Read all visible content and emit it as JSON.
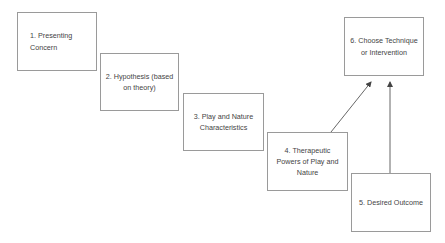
{
  "diagram": {
    "nodes": [
      {
        "id": 1,
        "label": "1. Presenting Concern",
        "lines": [
          "1. Presenting",
          "Concern"
        ]
      },
      {
        "id": 2,
        "label": "2. Hypothesis (based on theory)",
        "lines": [
          "2. Hypothesis (based",
          "on theory)"
        ]
      },
      {
        "id": 3,
        "label": "3. Play and Nature Characteristics",
        "lines": [
          "3. Play and Nature",
          "Characteristics"
        ]
      },
      {
        "id": 4,
        "label": "4. Therapeutic Powers of Play and Nature",
        "lines": [
          "4. Therapeutic",
          "Powers of Play and",
          "Nature"
        ]
      },
      {
        "id": 5,
        "label": "5. Desired Outcome",
        "lines": [
          "5. Desired Outcome"
        ]
      },
      {
        "id": 6,
        "label": "6. Choose Technique or Intervention",
        "lines": [
          "6. Choose Technique",
          "or Intervention"
        ]
      }
    ],
    "edges": [
      {
        "from": 4,
        "to": 6
      },
      {
        "from": 5,
        "to": 6
      }
    ],
    "colors": {
      "border": "#9a9a9a",
      "text": "#444444",
      "arrow": "#555555"
    }
  }
}
